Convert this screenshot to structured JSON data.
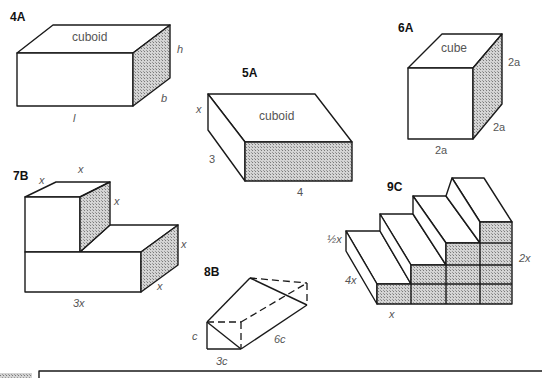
{
  "figures": [
    {
      "id": "4A",
      "label": "4A",
      "shape_name": "cuboid",
      "dimensions": {
        "length": "l",
        "breadth": "b",
        "height": "h"
      }
    },
    {
      "id": "5A",
      "label": "5A",
      "shape_name": "cuboid",
      "dimensions": {
        "x": "x",
        "depth": "3",
        "width": "4"
      }
    },
    {
      "id": "6A",
      "label": "6A",
      "shape_name": "cube",
      "dimensions": {
        "height": "2a",
        "depth": "2a",
        "width": "2a"
      }
    },
    {
      "id": "7B",
      "label": "7B",
      "dimensions": {
        "top_depth": "x",
        "top_width": "x",
        "top_height": "x",
        "lower_height": "x",
        "lower_depth": "x",
        "lower_width": "3x"
      }
    },
    {
      "id": "8B",
      "label": "8B",
      "shape_name": "triangular prism",
      "dimensions": {
        "height": "c",
        "base": "3c",
        "length": "6c"
      }
    },
    {
      "id": "9C",
      "label": "9C",
      "shape_name": "staircase",
      "dimensions": {
        "step_height": "½x",
        "length": "4x",
        "total_height": "2x",
        "step_depth": "x"
      }
    }
  ],
  "colors": {
    "line": "#1a1a1a",
    "label": "#555555",
    "shade": "#bdbdbd"
  }
}
